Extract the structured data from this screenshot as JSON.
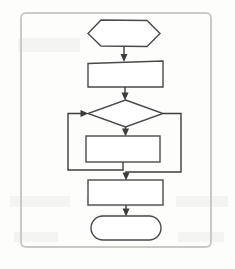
{
  "document": {
    "kind": "scanned-flowchart-figure",
    "frame": {
      "visible": true,
      "border_color": "#c9c9c6",
      "corner_style": "rounded"
    },
    "background_color": "#fdfdfc",
    "line_color": "#3d3d3d",
    "shape_fill": "#ffffff"
  },
  "flowchart": {
    "nodes": [
      {
        "id": "start",
        "shape": "hexagon",
        "role": "start-terminator",
        "label": "",
        "x": 88,
        "y": 20,
        "w": 72,
        "h": 27
      },
      {
        "id": "process-1",
        "shape": "rectangle",
        "role": "process",
        "label": "",
        "x": 88,
        "y": 61,
        "w": 75,
        "h": 26
      },
      {
        "id": "decision",
        "shape": "diamond",
        "role": "decision",
        "label": "",
        "x": 88,
        "y": 100,
        "w": 75,
        "h": 27
      },
      {
        "id": "loop-body",
        "shape": "rectangle",
        "role": "process",
        "label": "",
        "x": 86,
        "y": 136,
        "w": 74,
        "h": 26
      },
      {
        "id": "process-2",
        "shape": "rectangle",
        "role": "process",
        "label": "",
        "x": 88,
        "y": 180,
        "w": 75,
        "h": 25
      },
      {
        "id": "end",
        "shape": "rounded-rectangle",
        "role": "end-terminator",
        "label": "",
        "x": 91,
        "y": 216,
        "w": 70,
        "h": 24
      }
    ],
    "edges": [
      {
        "id": "e-start-process1",
        "from": "start",
        "to": "process-1",
        "label": "",
        "style": "straight-down",
        "arrow": true
      },
      {
        "id": "e-process1-decision",
        "from": "process-1",
        "to": "decision",
        "label": "",
        "style": "straight-down",
        "arrow": true
      },
      {
        "id": "e-decision-loopbody",
        "from": "decision",
        "to": "loop-body",
        "label": "",
        "style": "straight-down",
        "arrow": true
      },
      {
        "id": "e-loopback-left",
        "from": "loop-body",
        "to": "decision",
        "label": "",
        "style": "left-return",
        "arrow": true
      },
      {
        "id": "e-decision-bypass",
        "from": "decision",
        "to": "process-2",
        "label": "",
        "style": "right-bypass",
        "arrow": true
      },
      {
        "id": "e-process2-end",
        "from": "process-2",
        "to": "end",
        "label": "",
        "style": "straight-down",
        "arrow": true
      }
    ]
  }
}
